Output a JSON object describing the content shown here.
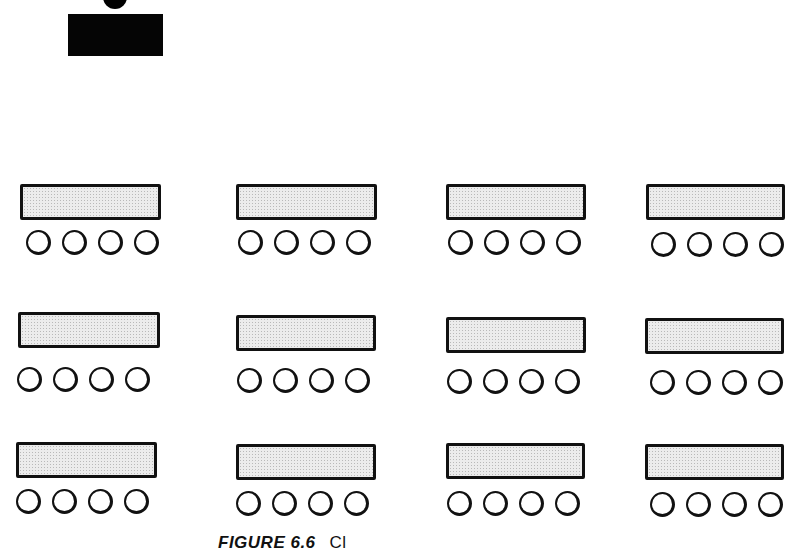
{
  "diagram": {
    "type": "classroom-seating-layout",
    "teacher": {
      "label": "teacher-desk"
    },
    "grid": {
      "rows": 3,
      "columns": 4,
      "chairs_per_desk": 4
    },
    "desks": [
      {
        "row": 1,
        "col": 1,
        "x": 20,
        "y": 184,
        "w": 141,
        "chairs_x": 26,
        "chairs_y": 230
      },
      {
        "row": 1,
        "col": 2,
        "x": 236,
        "y": 184,
        "w": 141,
        "chairs_x": 238,
        "chairs_y": 230
      },
      {
        "row": 1,
        "col": 3,
        "x": 446,
        "y": 184,
        "w": 140,
        "chairs_x": 448,
        "chairs_y": 230
      },
      {
        "row": 1,
        "col": 4,
        "x": 646,
        "y": 184,
        "w": 139,
        "chairs_x": 651,
        "chairs_y": 232
      },
      {
        "row": 2,
        "col": 1,
        "x": 18,
        "y": 312,
        "w": 142,
        "chairs_x": 17,
        "chairs_y": 367
      },
      {
        "row": 2,
        "col": 2,
        "x": 236,
        "y": 315,
        "w": 140,
        "chairs_x": 237,
        "chairs_y": 368
      },
      {
        "row": 2,
        "col": 3,
        "x": 446,
        "y": 317,
        "w": 140,
        "chairs_x": 447,
        "chairs_y": 369
      },
      {
        "row": 2,
        "col": 4,
        "x": 645,
        "y": 318,
        "w": 139,
        "chairs_x": 650,
        "chairs_y": 370
      },
      {
        "row": 3,
        "col": 1,
        "x": 16,
        "y": 442,
        "w": 141,
        "chairs_x": 16,
        "chairs_y": 489
      },
      {
        "row": 3,
        "col": 2,
        "x": 236,
        "y": 444,
        "w": 140,
        "chairs_x": 236,
        "chairs_y": 491
      },
      {
        "row": 3,
        "col": 3,
        "x": 446,
        "y": 443,
        "w": 139,
        "chairs_x": 447,
        "chairs_y": 491
      },
      {
        "row": 3,
        "col": 4,
        "x": 645,
        "y": 444,
        "w": 139,
        "chairs_x": 650,
        "chairs_y": 492
      }
    ]
  },
  "caption": {
    "label": "FIGURE 6.6",
    "text": "Cl"
  }
}
